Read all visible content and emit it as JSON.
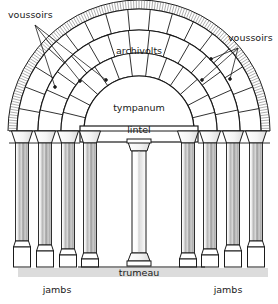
{
  "diagram": {
    "background_color": "#ffffff",
    "ink_color": "#1a1a1a",
    "shadow_color": "#d9d9d9",
    "stone_light": "#ffffff",
    "stone_mid": "#c9c9c9",
    "stone_dark": "#8f8f8f"
  },
  "labels": {
    "voussoirs_left": "voussoirs",
    "voussoirs_right": "voussoirs",
    "archivolts": "archivolts",
    "tympanum": "tympanum",
    "lintel": "lintel",
    "trumeau": "trumeau",
    "jambs_left": "jambs",
    "jambs_right": "jambs"
  },
  "label_positions": {
    "voussoirs_left": {
      "x": 8,
      "y": 18
    },
    "voussoirs_right": {
      "x": 228,
      "y": 41
    },
    "archivolts": {
      "x": 139,
      "y": 54
    },
    "tympanum": {
      "x": 139,
      "y": 111
    },
    "lintel": {
      "x": 139,
      "y": 133
    },
    "trumeau": {
      "x": 139,
      "y": 276
    },
    "jambs_left": {
      "x": 57,
      "y": 293
    },
    "jambs_right": {
      "x": 228,
      "y": 293
    }
  },
  "leaders": {
    "voussoirs_left_targets": [
      {
        "x": 55,
        "y": 87
      },
      {
        "x": 80,
        "y": 81
      },
      {
        "x": 106,
        "y": 80
      }
    ],
    "voussoirs_left_origin": {
      "x": 35,
      "y": 25
    },
    "voussoirs_right_targets": [
      {
        "x": 211,
        "y": 59
      },
      {
        "x": 202,
        "y": 80
      },
      {
        "x": 230,
        "y": 79
      }
    ],
    "voussoirs_right_origin": {
      "x": 238,
      "y": 48
    }
  },
  "geometry": {
    "arch_center": {
      "x": 139,
      "y": 131
    },
    "ring_radii": [
      55,
      78,
      101,
      122,
      131
    ],
    "ring_names": [
      "tympanum-arch",
      "archivolt-inner",
      "archivolt-mid",
      "archivolt-outer",
      "archivolt-hatched"
    ],
    "voussoir_counts": [
      13,
      15,
      17
    ],
    "lintel_top_y": 127,
    "lintel_bottom_y": 142,
    "ground_y": 267,
    "capital_y": 131,
    "capital_height": 12
  },
  "columns": {
    "left_x": [
      22,
      45,
      68,
      90
    ],
    "right_x": [
      188,
      210,
      233,
      256
    ],
    "width": 13,
    "base_heights": [
      26,
      22,
      18,
      14
    ],
    "base_width": 17
  },
  "trumeau": {
    "x": 139,
    "top_y": 150,
    "bottom_y": 258,
    "width": 12,
    "capital_y": 142,
    "base_y": 258
  },
  "counts": {
    "archivolt_rings": 4,
    "jamb_columns_per_side": 4,
    "trumeau_columns": 1
  }
}
